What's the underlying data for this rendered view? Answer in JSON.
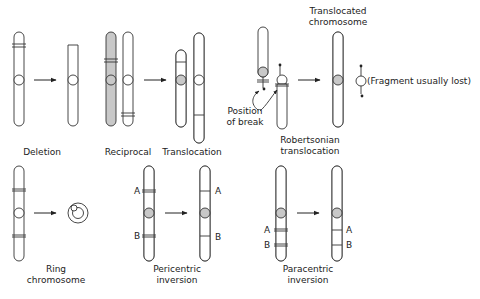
{
  "figure": {
    "colors": {
      "shaded": "#c8c8c8",
      "outline": "#333333",
      "background": "#ffffff"
    },
    "top_row": {
      "deletion": {
        "label": "Deletion"
      },
      "reciprocal_translocation": {
        "label_left": "Reciprocal",
        "label_right": "Translocation"
      },
      "robertsonian": {
        "break_label_1": "Position",
        "break_label_2": "of break",
        "label_1": "Robertsonian",
        "label_2": "translocation",
        "result_label_1": "Translocated",
        "result_label_2": "chromosome",
        "fragment_label": "(Fragment usually lost)"
      }
    },
    "bottom_row": {
      "ring": {
        "label_1": "Ring",
        "label_2": "chromosome"
      },
      "pericentric": {
        "label_1": "Pericentric",
        "label_2": "inversion",
        "marker_a": "A",
        "marker_b": "B"
      },
      "paracentric": {
        "label_1": "Paracentric",
        "label_2": "inversion",
        "marker_a": "A",
        "marker_b": "B"
      }
    }
  }
}
